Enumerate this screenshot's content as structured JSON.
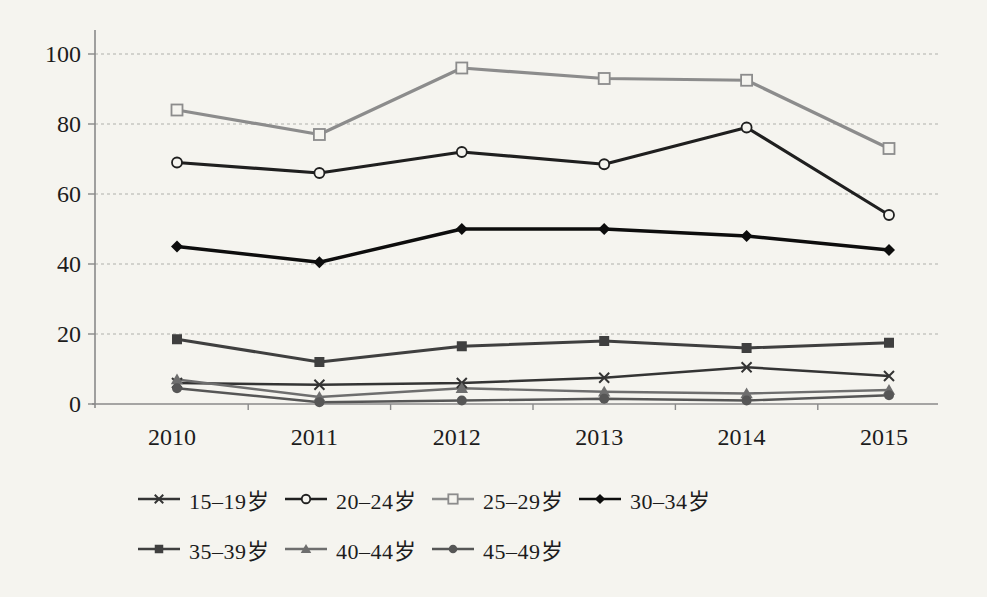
{
  "figure": {
    "background_color": "#f5f4ef",
    "axis_color": "#8a8a8a",
    "gridline_color": "#b0b0ac",
    "text_color": "#1c1c1c"
  },
  "chart_data": {
    "type": "line",
    "title": "",
    "xlabel": "",
    "ylabel": "",
    "categories": [
      "2010",
      "2011",
      "2012",
      "2013",
      "2014",
      "2015"
    ],
    "ylim": [
      0,
      100
    ],
    "yticks": [
      0,
      20,
      40,
      60,
      80,
      100
    ],
    "grid": "horizontal-dashed",
    "legend_position": "bottom",
    "legend_rows": [
      4,
      3
    ],
    "series": [
      {
        "name": "15–19岁",
        "marker": "x",
        "color": "#343434",
        "width": 2.4,
        "values": [
          6,
          5.5,
          6,
          7.5,
          10.5,
          8
        ]
      },
      {
        "name": "20–24岁",
        "marker": "circle-open",
        "color": "#1f1f1f",
        "width": 3.2,
        "values": [
          69,
          66,
          72,
          68.5,
          79,
          54
        ]
      },
      {
        "name": "25–29岁",
        "marker": "square-open",
        "color": "#8c8c8c",
        "width": 3.2,
        "values": [
          84,
          77,
          96,
          93,
          92.5,
          73
        ]
      },
      {
        "name": "30–34岁",
        "marker": "diamond",
        "color": "#0d0d0d",
        "width": 3.4,
        "values": [
          45,
          40.5,
          50,
          50,
          48,
          44
        ]
      },
      {
        "name": "35–39岁",
        "marker": "square",
        "color": "#3f3f3f",
        "width": 3.0,
        "values": [
          18.5,
          12,
          16.5,
          18,
          16,
          17.5
        ]
      },
      {
        "name": "40–44岁",
        "marker": "triangle",
        "color": "#6e6e6e",
        "width": 2.4,
        "values": [
          7,
          2,
          4.5,
          3.5,
          3,
          4
        ]
      },
      {
        "name": "45–49岁",
        "marker": "circle",
        "color": "#565656",
        "width": 2.4,
        "values": [
          4.5,
          0.5,
          1,
          1.5,
          1,
          2.5
        ]
      }
    ]
  }
}
